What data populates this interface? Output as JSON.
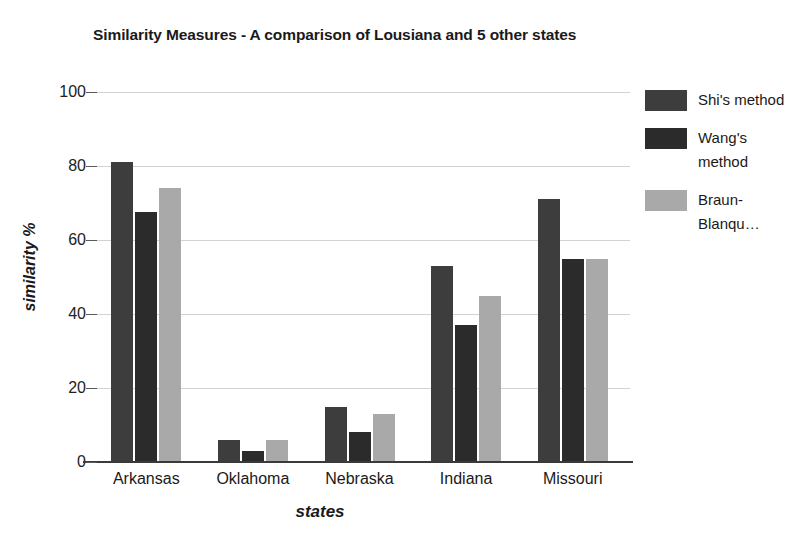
{
  "chart_data": {
    "type": "bar",
    "title": "Similarity Measures - A comparison of Lousiana and 5 other states",
    "xlabel": "states",
    "ylabel": "similarity %",
    "categories": [
      "Arkansas",
      "Oklahoma",
      "Nebraska",
      "Indiana",
      "Missouri"
    ],
    "series": [
      {
        "name": "Shi's method",
        "color": "#3d3d3d",
        "values": [
          81,
          6,
          15,
          53,
          71
        ]
      },
      {
        "name": "Wang's method",
        "color": "#2b2b2b",
        "values": [
          67.5,
          3,
          8,
          37,
          55
        ]
      },
      {
        "name": "Braun-Blanqu…",
        "color": "#a9a9a9",
        "values": [
          74,
          6,
          13,
          45,
          55
        ]
      }
    ],
    "ylim": [
      0,
      100
    ],
    "yticks": [
      0,
      20,
      40,
      60,
      80,
      100
    ],
    "ytick_labels": [
      "0",
      "20",
      "40",
      "60",
      "80",
      "100"
    ],
    "grid": true,
    "legend_position": "right",
    "background_color": "#ffffff",
    "gridline_color": "#d2d2d2",
    "axis_color": "#3a3a3a"
  }
}
